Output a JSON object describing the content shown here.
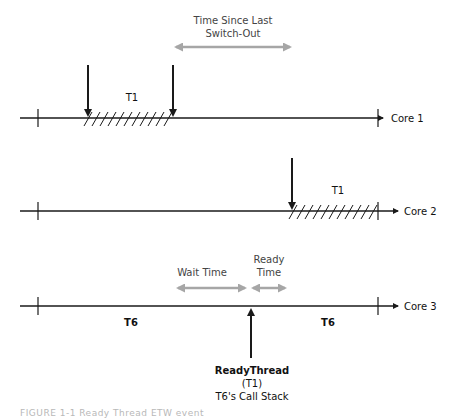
{
  "diagram": {
    "colors": {
      "line": "#1a1a1a",
      "gray_arrow": "#a6a6a6",
      "gray_text": "#444444"
    },
    "timelines": [
      {
        "label": "Core 1",
        "thread_label": "T1"
      },
      {
        "label": "Core 2",
        "thread_label": "T1"
      },
      {
        "label": "Core 3",
        "left_thread_label": "T6",
        "right_thread_label": "T6"
      }
    ],
    "annotations": {
      "time_since_last_switch_out": {
        "line1": "Time Since Last",
        "line2": "Switch-Out"
      },
      "wait_time": "Wait Time",
      "ready_time": {
        "line1": "Ready",
        "line2": "Time"
      }
    },
    "ready_thread": {
      "title": "ReadyThread",
      "subtitle": "(T1)",
      "call_stack": "T6's Call Stack"
    },
    "caption": "FIGURE 1-1  Ready Thread ETW event"
  }
}
